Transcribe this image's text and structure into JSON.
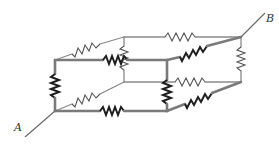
{
  "figure": {
    "type": "resistor-cube-circuit",
    "terminals": [
      {
        "id": "A",
        "label": "A",
        "vertex": "front-bottom-left"
      },
      {
        "id": "B",
        "label": "B",
        "vertex": "back-top-right"
      }
    ],
    "vertices": {
      "front-top-left": [
        55,
        60
      ],
      "front-top-right": [
        167,
        60
      ],
      "front-bottom-left": [
        55,
        111
      ],
      "front-bottom-right": [
        167,
        111
      ],
      "back-top-left": [
        124,
        37
      ],
      "back-top-right": [
        241,
        37
      ],
      "back-bottom-left": [
        124,
        82
      ],
      "back-bottom-right": [
        241,
        82
      ]
    },
    "edges_with_resistors": 12,
    "colors": {
      "background": "#ffffff",
      "wire": "#7a7a7a",
      "resistor": "#1e1e1e"
    }
  }
}
